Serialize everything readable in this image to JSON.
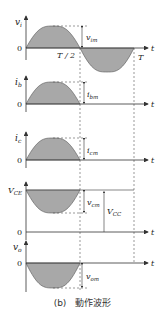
{
  "figure": {
    "caption": "(b)　動作波形",
    "colors": {
      "fill": "#a8a8a8",
      "axis": "#333333",
      "dash": "#555555"
    },
    "time_axis": {
      "label": "t",
      "half_period": "T / 2",
      "period": "T"
    },
    "panels": [
      {
        "id": "vi",
        "ylabel": "v",
        "ysub": "i",
        "zero": "0",
        "amp_label": "v",
        "amp_sub": "im",
        "waveform": "full-sine"
      },
      {
        "id": "ib",
        "ylabel": "i",
        "ysub": "b",
        "zero": "0",
        "amp_label": "i",
        "amp_sub": "bm",
        "waveform": "positive-half-sine"
      },
      {
        "id": "ic",
        "ylabel": "i",
        "ysub": "c",
        "zero": "",
        "amp_label": "i",
        "amp_sub": "cm",
        "waveform": "positive-half-sine"
      },
      {
        "id": "vce",
        "ylabel": "V",
        "ysub": "CE",
        "zero": "0",
        "amp_label": "v",
        "amp_sub": "cm",
        "dc_label": "V",
        "dc_sub": "CC",
        "waveform": "negative-half-sine-on-dc"
      },
      {
        "id": "vo",
        "ylabel": "v",
        "ysub": "o",
        "zero": "0",
        "amp_label": "v",
        "amp_sub": "om",
        "waveform": "negative-half-sine"
      }
    ]
  }
}
